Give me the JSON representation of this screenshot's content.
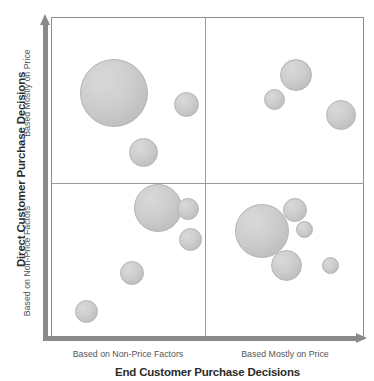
{
  "chart_data": {
    "type": "scatter",
    "title": "",
    "xlabel": "End Customer Purchase Decisions",
    "ylabel": "Direct Customer Purchase Decisions",
    "xlim": [
      0,
      100
    ],
    "ylim": [
      0,
      100
    ],
    "grid": false,
    "legend": "none",
    "x_quadrant_labels": [
      "Based on Non-Price Factors",
      "Based Mostly on Price"
    ],
    "y_quadrant_labels": [
      "Based on Non-Price Factors",
      "Based Mostly on Price"
    ],
    "x_divider": 50,
    "y_divider": 50,
    "bubble_fill": "#cdcdcd",
    "bubble_stroke": "#b4b4b4",
    "axis_color": "#8a8a8a",
    "frame_color": "#8e8e8e",
    "series": [
      {
        "name": "Customer accounts",
        "points": [
          {
            "quadrant": "top-left",
            "x": 18.5,
            "y": 71.0,
            "size": 68,
            "cx": 114,
            "cy": 93,
            "r": 34
          },
          {
            "quadrant": "top-left",
            "x": 43.0,
            "y": 69.0,
            "size": 25,
            "cx": 186,
            "cy": 104,
            "r": 12.5
          },
          {
            "quadrant": "top-left",
            "x": 30.0,
            "y": 55.5,
            "size": 29,
            "cx": 143,
            "cy": 152,
            "r": 14.5
          },
          {
            "quadrant": "top-right",
            "x": 68.5,
            "y": 83.5,
            "size": 32,
            "cx": 296,
            "cy": 75,
            "r": 16
          },
          {
            "quadrant": "top-right",
            "x": 60.5,
            "y": 75.5,
            "size": 21,
            "cx": 274,
            "cy": 99,
            "r": 10.5
          },
          {
            "quadrant": "top-right",
            "x": 89.5,
            "y": 68.5,
            "size": 30,
            "cx": 341,
            "cy": 115,
            "r": 15
          },
          {
            "quadrant": "bottom-left",
            "x": 35.0,
            "y": 43.0,
            "size": 48,
            "cx": 158,
            "cy": 208,
            "r": 24
          },
          {
            "quadrant": "bottom-left",
            "x": 46.5,
            "y": 44.0,
            "size": 22,
            "cx": 188,
            "cy": 209,
            "r": 11
          },
          {
            "quadrant": "bottom-left",
            "x": 47.0,
            "y": 36.5,
            "size": 23,
            "cx": 190,
            "cy": 239,
            "r": 11.5
          },
          {
            "quadrant": "bottom-left",
            "x": 30.0,
            "y": 25.0,
            "size": 24,
            "cx": 132,
            "cy": 273,
            "r": 12
          },
          {
            "quadrant": "bottom-left",
            "x": 11.5,
            "y": 13.0,
            "size": 23,
            "cx": 86,
            "cy": 311,
            "r": 11.5
          },
          {
            "quadrant": "bottom-right",
            "x": 59.5,
            "y": 37.5,
            "size": 54,
            "cx": 262,
            "cy": 231,
            "r": 27
          },
          {
            "quadrant": "bottom-right",
            "x": 72.5,
            "y": 44.5,
            "size": 24,
            "cx": 295,
            "cy": 210,
            "r": 12
          },
          {
            "quadrant": "bottom-right",
            "x": 75.5,
            "y": 39.5,
            "size": 17,
            "cx": 304,
            "cy": 229,
            "r": 8.5
          },
          {
            "quadrant": "bottom-right",
            "x": 66.5,
            "y": 26.5,
            "size": 31,
            "cx": 286,
            "cy": 265,
            "r": 15.5
          },
          {
            "quadrant": "bottom-right",
            "x": 83.0,
            "y": 27.5,
            "size": 17,
            "cx": 330,
            "cy": 265,
            "r": 8.5
          }
        ]
      }
    ]
  },
  "axes": {
    "y": {
      "title": "Direct Customer Purchase Decisions",
      "sub_top": "Based Mostly on Price",
      "sub_bottom": "Based on Non-Price Factors"
    },
    "x": {
      "title": "End Customer Purchase Decisions",
      "sub_left": "Based on Non-Price Factors",
      "sub_right": "Based Mostly on Price"
    }
  }
}
